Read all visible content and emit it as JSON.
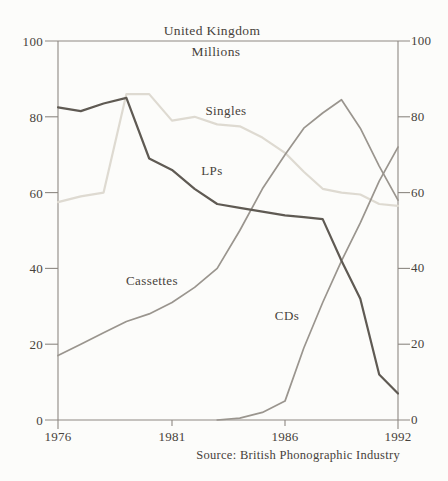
{
  "chart_data": {
    "type": "line",
    "title": "United Kingdom",
    "subtitle": "Millions",
    "source": "Source: British Phonographic Industry",
    "x": [
      1976,
      1977,
      1978,
      1979,
      1980,
      1981,
      1982,
      1983,
      1984,
      1985,
      1986,
      1987,
      1988,
      1989,
      1990,
      1991,
      1992
    ],
    "x_tick_labels": [
      "1976",
      "1981",
      "1986",
      "1992"
    ],
    "x_tick_years": [
      1976,
      1981,
      1986,
      1992
    ],
    "y_tick_labels": [
      "100",
      "80",
      "60",
      "40",
      "20",
      "0"
    ],
    "y_tick_values": [
      100,
      80,
      60,
      40,
      20,
      0
    ],
    "ylim": [
      0,
      100
    ],
    "grid": false,
    "dual_y_axis": true,
    "legend_position": "inline-labels",
    "series": [
      {
        "name": "Singles",
        "color": "#dedad1",
        "width": 2.2,
        "values": [
          57.5,
          59,
          60,
          86,
          86,
          79,
          80,
          78,
          77.5,
          74.5,
          70.5,
          65.5,
          61,
          60,
          59.5,
          57,
          56.5
        ]
      },
      {
        "name": "Cassettes",
        "color": "#9a958e",
        "width": 1.7,
        "values": [
          17,
          20,
          23,
          26,
          28,
          31,
          35,
          40,
          50,
          61,
          70,
          77,
          81,
          84.5,
          77,
          67,
          58
        ]
      },
      {
        "name": "CDs",
        "color": "#9a958e",
        "width": 1.7,
        "values": [
          null,
          null,
          null,
          null,
          null,
          null,
          null,
          0,
          0.5,
          2,
          5,
          19,
          31,
          42,
          52,
          63,
          72
        ]
      },
      {
        "name": "LPs",
        "color": "#5f5a53",
        "width": 2.2,
        "values": [
          82.5,
          81.5,
          83.5,
          85,
          69,
          66,
          61,
          57,
          56,
          55,
          54,
          53.5,
          53,
          42,
          32,
          12,
          7
        ]
      }
    ]
  },
  "colors": {
    "background": "#fcfcfa",
    "axis": "#8d8882",
    "text": "#47423b"
  }
}
